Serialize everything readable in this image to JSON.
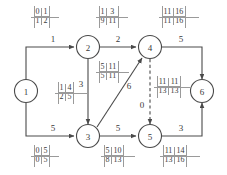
{
  "diagram": {
    "colors": {
      "stroke": "#4a4a4a",
      "text": "#3a3a3a",
      "grid": "#9a9a9a",
      "background": "#ffffff"
    },
    "nodes": [
      {
        "id": "n1",
        "label": "1",
        "cx": 26,
        "cy": 91
      },
      {
        "id": "n2",
        "label": "2",
        "cx": 88,
        "cy": 47
      },
      {
        "id": "n3",
        "label": "3",
        "cx": 88,
        "cy": 136
      },
      {
        "id": "n4",
        "label": "4",
        "cx": 150,
        "cy": 47
      },
      {
        "id": "n5",
        "label": "5",
        "cx": 150,
        "cy": 136
      },
      {
        "id": "n6",
        "label": "6",
        "cx": 202,
        "cy": 91
      }
    ],
    "edges": [
      {
        "id": "e12",
        "from": "1",
        "to": "2",
        "weight": "1",
        "style": "solid"
      },
      {
        "id": "e24",
        "from": "2",
        "to": "4",
        "weight": "2",
        "style": "solid"
      },
      {
        "id": "e46",
        "from": "4",
        "to": "6",
        "weight": "5",
        "style": "solid"
      },
      {
        "id": "e23",
        "from": "2",
        "to": "3",
        "weight": "3",
        "style": "solid"
      },
      {
        "id": "e34",
        "from": "3",
        "to": "4",
        "weight": "6",
        "style": "solid"
      },
      {
        "id": "e45",
        "from": "4",
        "to": "5",
        "weight": "0",
        "style": "dashed"
      },
      {
        "id": "e13",
        "from": "1",
        "to": "3",
        "weight": "5",
        "style": "solid"
      },
      {
        "id": "e35",
        "from": "3",
        "to": "5",
        "weight": "5",
        "style": "solid"
      },
      {
        "id": "e56",
        "from": "5",
        "to": "6",
        "weight": "3",
        "style": "solid"
      }
    ],
    "tables": [
      {
        "id": "t12",
        "edge": "e12",
        "tl": "0",
        "tr": "1",
        "bl": "1",
        "br": "2"
      },
      {
        "id": "t24",
        "edge": "e24",
        "tl": "1",
        "tr": "3",
        "bl": "9",
        "br": "11"
      },
      {
        "id": "t46",
        "edge": "e46",
        "tl": "11",
        "tr": "16",
        "bl": "11",
        "br": "16"
      },
      {
        "id": "t23",
        "edge": "e23",
        "tl": "1",
        "tr": "4",
        "bl": "2",
        "br": "5"
      },
      {
        "id": "t34",
        "edge": "e34",
        "tl": "5",
        "tr": "11",
        "bl": "5",
        "br": "11"
      },
      {
        "id": "t45",
        "edge": "e45",
        "tl": "11",
        "tr": "11",
        "bl": "13",
        "br": "13"
      },
      {
        "id": "t13",
        "edge": "e13",
        "tl": "0",
        "tr": "5",
        "bl": "0",
        "br": "5"
      },
      {
        "id": "t35",
        "edge": "e35",
        "tl": "5",
        "tr": "10",
        "bl": "8",
        "br": "13"
      },
      {
        "id": "t56",
        "edge": "e56",
        "tl": "11",
        "tr": "14",
        "bl": "13",
        "br": "16"
      }
    ]
  }
}
